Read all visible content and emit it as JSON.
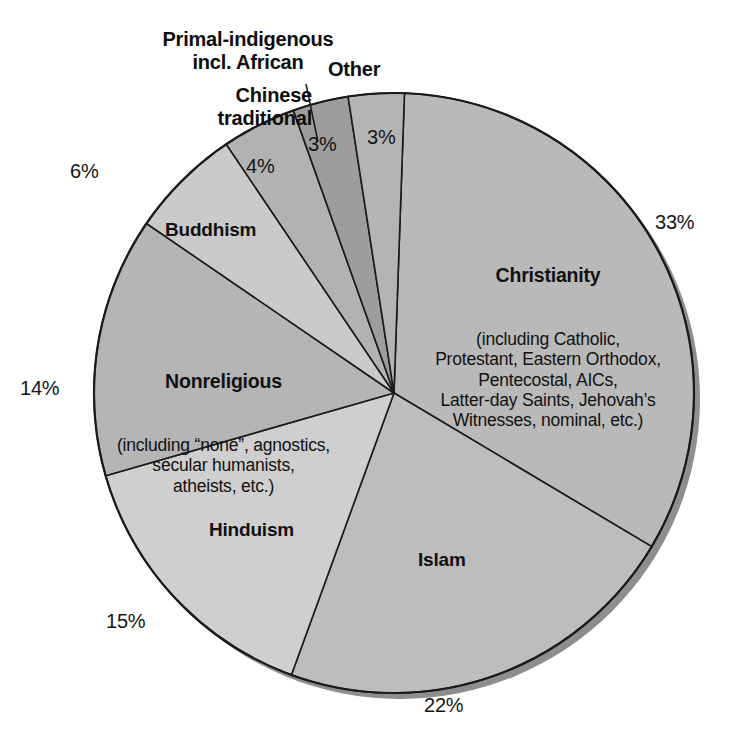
{
  "chart_data": {
    "type": "pie",
    "title": "",
    "subtitle": "",
    "legend_position": "none",
    "grid": false,
    "units": "percent",
    "categories": [
      "Christianity",
      "Islam",
      "Hinduism",
      "Nonreligious",
      "Buddhism",
      "Chinese traditional",
      "Primal-indigenous incl. African",
      "Other"
    ],
    "values": [
      33,
      22,
      15,
      14,
      6,
      4,
      3,
      3
    ],
    "slices": [
      {
        "key": "christianity",
        "label": "Christianity",
        "percent_text": "33%",
        "percent": 33,
        "detail_lines": [
          "(including Catholic,",
          "Protestant, Eastern Orthodox,",
          "Pentecostal, AICs,",
          "Latter-day Saints, Jehovah’s",
          "Witnesses, nominal, etc.)"
        ],
        "fill": "#b9b9b9",
        "label_placement": "inside",
        "percent_placement": "outside-right"
      },
      {
        "key": "islam",
        "label": "Islam",
        "percent_text": "22%",
        "percent": 22,
        "detail_lines": [],
        "fill": "#bdbdbd",
        "label_placement": "inside",
        "percent_placement": "outside-bottom"
      },
      {
        "key": "hinduism",
        "label": "Hinduism",
        "percent_text": "15%",
        "percent": 15,
        "detail_lines": [],
        "fill": "#cfcfcf",
        "label_placement": "inside",
        "percent_placement": "outside-bottom-left"
      },
      {
        "key": "nonreligious",
        "label": "Nonreligious",
        "percent_text": "14%",
        "percent": 14,
        "detail_lines": [
          "(including “none”, agnostics,",
          "secular humanists,",
          "atheists, etc.)"
        ],
        "fill": "#b5b5b5",
        "label_placement": "inside",
        "percent_placement": "outside-left"
      },
      {
        "key": "buddhism",
        "label": "Buddhism",
        "percent_text": "6%",
        "percent": 6,
        "detail_lines": [],
        "fill": "#cacaca",
        "label_placement": "inside",
        "percent_placement": "outside-upper-left"
      },
      {
        "key": "chinese-traditional",
        "label": "Chinese\ntraditional",
        "percent_text": "4%",
        "percent": 4,
        "detail_lines": [],
        "fill": "#b2b2b2",
        "label_placement": "callout",
        "percent_placement": "inside"
      },
      {
        "key": "primal-indigenous",
        "label": "Primal-indigenous\nincl. African",
        "percent_text": "3%",
        "percent": 3,
        "detail_lines": [],
        "fill": "#9d9d9d",
        "label_placement": "callout-leader",
        "percent_placement": "inside"
      },
      {
        "key": "other",
        "label": "Other",
        "percent_text": "3%",
        "percent": 3,
        "detail_lines": [],
        "fill": "#b4b4b4",
        "label_placement": "callout",
        "percent_placement": "inside"
      }
    ]
  },
  "labels": {
    "christianity_title": "Christianity",
    "christianity_detail": "(including Catholic,\nProtestant, Eastern Orthodox,\nPentecostal, AICs,\nLatter-day Saints, Jehovah’s\nWitnesses, nominal, etc.)",
    "christianity_pct": "33%",
    "islam_title": "Islam",
    "islam_pct": "22%",
    "hinduism_title": "Hinduism",
    "hinduism_pct": "15%",
    "nonreligious_title": "Nonreligious",
    "nonreligious_detail": "(including “none”, agnostics,\nsecular humanists,\natheists, etc.)",
    "nonreligious_pct": "14%",
    "buddhism_title": "Buddhism",
    "buddhism_pct": "6%",
    "chinese_title": "Chinese\ntraditional",
    "chinese_pct": "4%",
    "primal_title": "Primal-indigenous\nincl. African",
    "primal_pct": "3%",
    "other_title": "Other",
    "other_pct": "3%"
  },
  "geometry": {
    "cx": 394,
    "cy": 393,
    "r": 300,
    "start_angle_deg": -88
  },
  "colors": {
    "background": "#ffffff",
    "outline": "#1a1a1a",
    "shadow": "#8e8e8e",
    "text": "#111111"
  }
}
